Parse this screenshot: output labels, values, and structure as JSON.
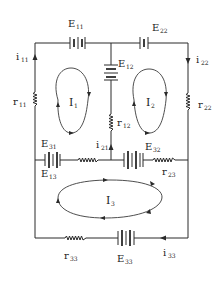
{
  "diagram": {
    "type": "electrical-circuit",
    "loops": [
      {
        "id": "loop-1",
        "label": "I",
        "sub": "1"
      },
      {
        "id": "loop-2",
        "label": "I",
        "sub": "2"
      },
      {
        "id": "loop-3",
        "label": "I",
        "sub": "3"
      }
    ],
    "emfs": [
      {
        "id": "E11",
        "label": "E",
        "sub": "11"
      },
      {
        "id": "E22",
        "label": "E",
        "sub": "22"
      },
      {
        "id": "E12",
        "label": "E",
        "sub": "12"
      },
      {
        "id": "E31",
        "label": "E",
        "sub": "31"
      },
      {
        "id": "E13",
        "label": "E",
        "sub": "13"
      },
      {
        "id": "E32",
        "label": "E",
        "sub": "32"
      },
      {
        "id": "E33",
        "label": "E",
        "sub": "33"
      }
    ],
    "resistors": [
      {
        "id": "r11",
        "label": "r",
        "sub": "11"
      },
      {
        "id": "r22",
        "label": "r",
        "sub": "22"
      },
      {
        "id": "r12",
        "label": "r",
        "sub": "12"
      },
      {
        "id": "r23",
        "label": "r",
        "sub": "23"
      },
      {
        "id": "r33",
        "label": "r",
        "sub": "33"
      }
    ],
    "branch_currents": [
      {
        "id": "i11",
        "label": "i",
        "sub": "11"
      },
      {
        "id": "i22",
        "label": "i",
        "sub": "22"
      },
      {
        "id": "i21",
        "label": "i",
        "sub": "21"
      },
      {
        "id": "i33",
        "label": "i",
        "sub": "33"
      }
    ]
  }
}
